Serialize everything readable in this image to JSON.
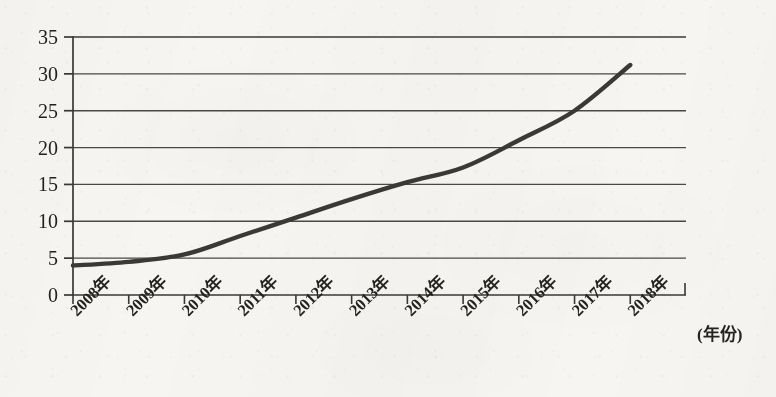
{
  "chart_data": {
    "type": "line",
    "title": "",
    "subtitle": "",
    "xlabel": "(年份)",
    "ylabel": "",
    "categories": [
      "2008年",
      "2009年",
      "2010年",
      "2011年",
      "2012年",
      "2013年",
      "2014年",
      "2015年",
      "2016年",
      "2017年",
      "2018年"
    ],
    "x": [
      2008,
      2009,
      2010,
      2011,
      2012,
      2013,
      2014,
      2015,
      2016,
      2017,
      2018
    ],
    "values": [
      4.0,
      4.5,
      5.5,
      8.0,
      10.5,
      13.0,
      15.3,
      17.3,
      21.0,
      25.0,
      31.2
    ],
    "series": [
      {
        "name": "",
        "values": [
          4.0,
          4.5,
          5.5,
          8.0,
          10.5,
          13.0,
          15.3,
          17.3,
          21.0,
          25.0,
          31.2
        ]
      }
    ],
    "ylim": [
      0,
      35
    ],
    "yticks": [
      0,
      5,
      10,
      15,
      20,
      25,
      30,
      35
    ],
    "ytick_labels": [
      "0",
      "5",
      "10",
      "15",
      "20",
      "25",
      "30",
      "35"
    ],
    "grid": true,
    "grid_axis": "y",
    "legend": false,
    "legend_position": "none",
    "markers": false,
    "x_tick_rotation": -45,
    "line_color": "#3b3936",
    "grid_color": "#4a4845",
    "axis_color": "#3a3835",
    "background_color": "#f6f5f2",
    "text_color": "#26231f"
  },
  "figure": {
    "caption_x_axis": "(年份)"
  }
}
